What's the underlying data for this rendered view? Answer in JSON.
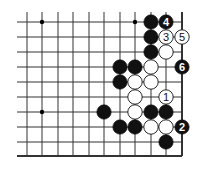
{
  "diagram": {
    "type": "go-problem",
    "visible_columns": 11,
    "visible_rows": 10,
    "edges": {
      "right": true,
      "bottom": true,
      "top": false,
      "left": false
    },
    "grid": {
      "col_x": [
        27,
        42,
        58,
        73,
        89,
        104,
        120,
        135,
        151,
        166,
        182
      ],
      "row_y": [
        22,
        37,
        52,
        67,
        82,
        97,
        112,
        127,
        142,
        156
      ],
      "line_left": 17,
      "line_top": 12
    },
    "star_points": [
      {
        "col": 1,
        "row": 0
      },
      {
        "col": 7,
        "row": 0
      },
      {
        "col": 1,
        "row": 6
      }
    ],
    "colors": {
      "line": "#333333",
      "black_stone": "#111111",
      "white_stone": "#ffffff",
      "background": "#ffffff"
    },
    "stones": [
      {
        "color": "black",
        "col": 8,
        "row": 0,
        "label": ""
      },
      {
        "color": "black",
        "col": 9,
        "row": 0,
        "label": "4"
      },
      {
        "color": "black",
        "col": 8,
        "row": 1,
        "label": ""
      },
      {
        "color": "white",
        "col": 9,
        "row": 1,
        "label": "3"
      },
      {
        "color": "white",
        "col": 10,
        "row": 1,
        "label": "5"
      },
      {
        "color": "black",
        "col": 8,
        "row": 2,
        "label": ""
      },
      {
        "color": "white",
        "col": 9,
        "row": 2,
        "label": ""
      },
      {
        "color": "black",
        "col": 6,
        "row": 3,
        "label": ""
      },
      {
        "color": "black",
        "col": 7,
        "row": 3,
        "label": ""
      },
      {
        "color": "white",
        "col": 8,
        "row": 3,
        "label": ""
      },
      {
        "color": "black",
        "col": 10,
        "row": 3,
        "label": "6"
      },
      {
        "color": "black",
        "col": 6,
        "row": 4,
        "label": ""
      },
      {
        "color": "white",
        "col": 7,
        "row": 4,
        "label": ""
      },
      {
        "color": "white",
        "col": 8,
        "row": 4,
        "label": ""
      },
      {
        "color": "white",
        "col": 7,
        "row": 5,
        "label": ""
      },
      {
        "color": "white",
        "col": 9,
        "row": 5,
        "label": "1"
      },
      {
        "color": "black",
        "col": 5,
        "row": 6,
        "label": ""
      },
      {
        "color": "white",
        "col": 7,
        "row": 6,
        "label": ""
      },
      {
        "color": "black",
        "col": 8,
        "row": 6,
        "label": ""
      },
      {
        "color": "black",
        "col": 9,
        "row": 6,
        "label": ""
      },
      {
        "color": "black",
        "col": 6,
        "row": 7,
        "label": ""
      },
      {
        "color": "black",
        "col": 7,
        "row": 7,
        "label": ""
      },
      {
        "color": "white",
        "col": 8,
        "row": 7,
        "label": ""
      },
      {
        "color": "white",
        "col": 9,
        "row": 7,
        "label": ""
      },
      {
        "color": "black",
        "col": 10,
        "row": 7,
        "label": "2"
      },
      {
        "color": "black",
        "col": 9,
        "row": 8,
        "label": ""
      }
    ]
  }
}
